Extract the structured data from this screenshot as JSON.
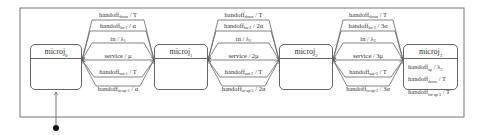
{
  "diagram": {
    "type": "state-machine",
    "states": [
      {
        "id": "micro0",
        "name": "microj",
        "index": "0",
        "internal": []
      },
      {
        "id": "micro1",
        "name": "microj",
        "index": "1",
        "internal": []
      },
      {
        "id": "micro2",
        "name": "microj",
        "index": "2",
        "internal": []
      },
      {
        "id": "micro3",
        "name": "microj",
        "index": "3",
        "internal": [
          {
            "event": "handoff",
            "sub": "up",
            "action": "/ λ",
            "asub": "3"
          },
          {
            "event": "handoff",
            "sub": "down",
            "action": "/ T",
            "asub": ""
          },
          {
            "event": "handoff",
            "sub": "int-up-3",
            "action": "/ T",
            "asub": ""
          }
        ]
      }
    ],
    "transitions": [
      {
        "group": 0,
        "event": "handoff",
        "sub": "down",
        "action": "/ T",
        "asub": ""
      },
      {
        "group": 0,
        "event": "handoff",
        "sub": "ho-1",
        "action": "/ α",
        "asub": ""
      },
      {
        "group": 0,
        "event": "in",
        "sub": "",
        "action": "/ λ",
        "asub": "1"
      },
      {
        "group": 0,
        "event": "service",
        "sub": "",
        "action": "/ μ",
        "asub": ""
      },
      {
        "group": 0,
        "event": "handoff",
        "sub": "out-1",
        "action": "/ T",
        "asub": ""
      },
      {
        "group": 0,
        "event": "handoff",
        "sub": "in-up-1",
        "action": "/ α",
        "asub": ""
      },
      {
        "group": 1,
        "event": "handoff",
        "sub": "down",
        "action": "/ T",
        "asub": ""
      },
      {
        "group": 1,
        "event": "handoff",
        "sub": "ho-2",
        "action": "/ 2α",
        "asub": ""
      },
      {
        "group": 1,
        "event": "in",
        "sub": "",
        "action": "/ λ",
        "asub": "2"
      },
      {
        "group": 1,
        "event": "service",
        "sub": "",
        "action": "/ 2μ",
        "asub": ""
      },
      {
        "group": 1,
        "event": "handoff",
        "sub": "out-2",
        "action": "/ T",
        "asub": ""
      },
      {
        "group": 1,
        "event": "handoff",
        "sub": "in-up-2",
        "action": "/ 2α",
        "asub": ""
      },
      {
        "group": 2,
        "event": "handoff",
        "sub": "down",
        "action": "/ T",
        "asub": ""
      },
      {
        "group": 2,
        "event": "handoff",
        "sub": "ho-3",
        "action": "/ 3α",
        "asub": ""
      },
      {
        "group": 2,
        "event": "in",
        "sub": "",
        "action": "/ λ",
        "asub": "2"
      },
      {
        "group": 2,
        "event": "service",
        "sub": "",
        "action": "/ 3μ",
        "asub": ""
      },
      {
        "group": 2,
        "event": "handoff",
        "sub": "out-3",
        "action": "/ T",
        "asub": ""
      },
      {
        "group": 2,
        "event": "handoff",
        "sub": "in-up-3",
        "action": "/ 3α",
        "asub": ""
      }
    ],
    "initial_state": "micro0"
  }
}
